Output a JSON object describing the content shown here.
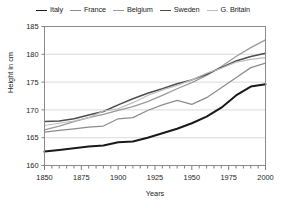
{
  "chart_data": {
    "type": "line",
    "title": "",
    "xlabel": "Years",
    "ylabel": "Height in cm",
    "xlim": [
      1850,
      2000
    ],
    "ylim": [
      160,
      185
    ],
    "xticks": [
      1850,
      1875,
      1900,
      1925,
      1950,
      1975,
      2000
    ],
    "yticks": [
      160,
      165,
      170,
      175,
      180,
      185
    ],
    "xtick_labels": [
      "1850",
      "1875",
      "1900",
      "1925",
      "1950",
      "1975",
      "2000"
    ],
    "ytick_labels": [
      "160",
      "165",
      "170",
      "175",
      "180",
      "185"
    ],
    "minor_xtick_interval": 5,
    "grid": "horizontal",
    "legend_position": "top-center",
    "x": [
      1850,
      1860,
      1870,
      1880,
      1890,
      1900,
      1910,
      1920,
      1930,
      1940,
      1950,
      1960,
      1970,
      1980,
      1990,
      2000
    ],
    "series": [
      {
        "name": "Italy",
        "color": "#1a1a1a",
        "values": [
          162.5,
          162.8,
          163.1,
          163.4,
          163.6,
          164.2,
          164.3,
          165.0,
          165.8,
          166.6,
          167.6,
          168.8,
          170.4,
          172.6,
          174.2,
          174.6
        ]
      },
      {
        "name": "France",
        "color": "#8c8c8c",
        "values": [
          166.0,
          166.3,
          166.6,
          166.9,
          167.1,
          168.4,
          168.6,
          169.9,
          170.9,
          171.7,
          171.0,
          172.2,
          174.0,
          175.8,
          177.6,
          178.4
        ]
      },
      {
        "name": "Belgium",
        "color": "#9a9a9a",
        "values": [
          166.4,
          167.1,
          167.9,
          168.6,
          169.2,
          169.9,
          170.6,
          171.5,
          172.6,
          173.8,
          174.9,
          176.2,
          177.8,
          179.6,
          181.2,
          182.6
        ]
      },
      {
        "name": "Sweden",
        "color": "#4d4d4d",
        "values": [
          167.9,
          168.0,
          168.4,
          169.1,
          169.7,
          170.9,
          172.0,
          173.0,
          173.8,
          174.7,
          175.4,
          176.4,
          177.6,
          178.8,
          179.6,
          180.2
        ]
      },
      {
        "name": "G. Britain",
        "color": "#bdbdbd",
        "values": [
          167.2,
          167.6,
          168.0,
          168.6,
          169.8,
          170.2,
          171.3,
          172.6,
          173.6,
          174.4,
          175.4,
          176.6,
          177.5,
          178.6,
          179.1,
          179.4
        ]
      }
    ]
  },
  "legend": {
    "items": [
      {
        "label": "Italy",
        "color": "#1a1a1a",
        "width": "1.9px"
      },
      {
        "label": "France",
        "color": "#8c8c8c",
        "width": "1.3px"
      },
      {
        "label": "Belgium",
        "color": "#9a9a9a",
        "width": "1.3px"
      },
      {
        "label": "Sweden",
        "color": "#4d4d4d",
        "width": "1.5px"
      },
      {
        "label": "G. Britain",
        "color": "#bdbdbd",
        "width": "1.3px"
      }
    ]
  },
  "axes": {
    "y_title": "Height in cm",
    "x_title": "Years"
  }
}
